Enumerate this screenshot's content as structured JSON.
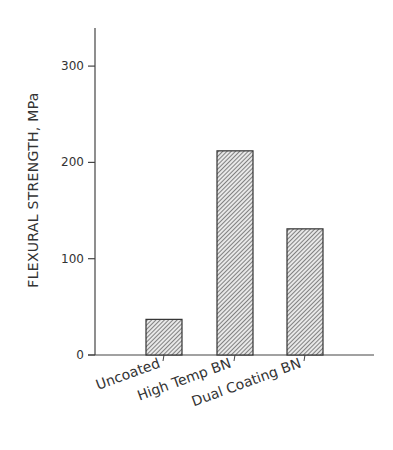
{
  "chart_data": {
    "type": "bar",
    "title": "",
    "xlabel": "",
    "ylabel": "FLEXURAL STRENGTH, MPa",
    "categories": [
      "Uncoated",
      "High Temp BN",
      "Dual Coating BN"
    ],
    "values": [
      37,
      212,
      131
    ],
    "ylim": [
      0,
      340
    ],
    "yticks": [
      0,
      100,
      200,
      300
    ],
    "ytick_labels": [
      "0",
      "100",
      "200",
      "300"
    ],
    "grid": false,
    "legend": null,
    "bar_style": "diagonal-hatch",
    "colors": {
      "axis": "#444444",
      "bar_edge": "#333333",
      "hatch": "#555555",
      "bar_fill": "#e6e6e6"
    }
  }
}
